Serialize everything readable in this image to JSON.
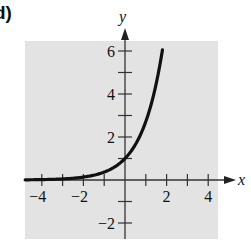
{
  "panel_label": "d)",
  "chart_data": {
    "type": "line",
    "title": "",
    "xlabel": "x",
    "ylabel": "y",
    "function": "y = e^x",
    "xlim": [
      -4.8,
      4.5
    ],
    "ylim": [
      -2.8,
      6.5
    ],
    "x_ticks": [
      -4,
      -3,
      -2,
      -1,
      1,
      2,
      3,
      4
    ],
    "x_tick_labels": [
      {
        "value": -4,
        "label": "−4"
      },
      {
        "value": -2,
        "label": "−2"
      },
      {
        "value": 2,
        "label": "2"
      },
      {
        "value": 4,
        "label": "4"
      }
    ],
    "y_ticks": [
      -2,
      -1,
      1,
      2,
      3,
      4,
      5,
      6
    ],
    "y_tick_labels": [
      {
        "value": 6,
        "label": "6"
      },
      {
        "value": 4,
        "label": "4"
      },
      {
        "value": 2,
        "label": "2"
      },
      {
        "value": -2,
        "label": "−2"
      }
    ],
    "series": [
      {
        "name": "y = e^x",
        "x": [
          -4.8,
          -4,
          -3,
          -2,
          -1,
          0,
          0.5,
          1,
          1.5,
          1.8
        ],
        "values": [
          0.008,
          0.018,
          0.05,
          0.135,
          0.368,
          1,
          1.65,
          2.72,
          4.48,
          6.05
        ]
      }
    ],
    "grid": false,
    "background": "#e3e3e3",
    "curve_color": "#111111",
    "legend": null
  }
}
